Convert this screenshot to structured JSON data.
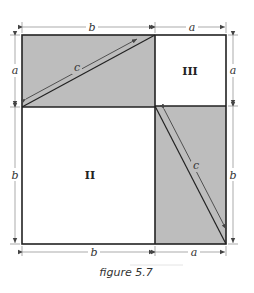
{
  "figure": {
    "caption": "figure 5.7",
    "fill_color": "#bdbdbd",
    "line_color": "#222222"
  },
  "regions": [
    {
      "id": "top-left-rectangle",
      "shaded": true,
      "dims": "b x a",
      "diagonal_label": "c"
    },
    {
      "id": "top-right-square",
      "shaded": false,
      "label": "III",
      "dims": "a x a"
    },
    {
      "id": "bottom-left-square",
      "shaded": false,
      "label": "II",
      "dims": "b x b"
    },
    {
      "id": "bottom-right-rectangle",
      "shaded": true,
      "dims": "a x b",
      "diagonal_label": "c"
    }
  ],
  "labels": {
    "top_b": "b",
    "top_a": "a",
    "left_a": "a",
    "left_b": "b",
    "right_a": "a",
    "right_b": "b",
    "bottom_b": "b",
    "bottom_a": "a",
    "diag_top": "c",
    "diag_bottom": "c",
    "region_ii": "II",
    "region_iii": "III"
  }
}
